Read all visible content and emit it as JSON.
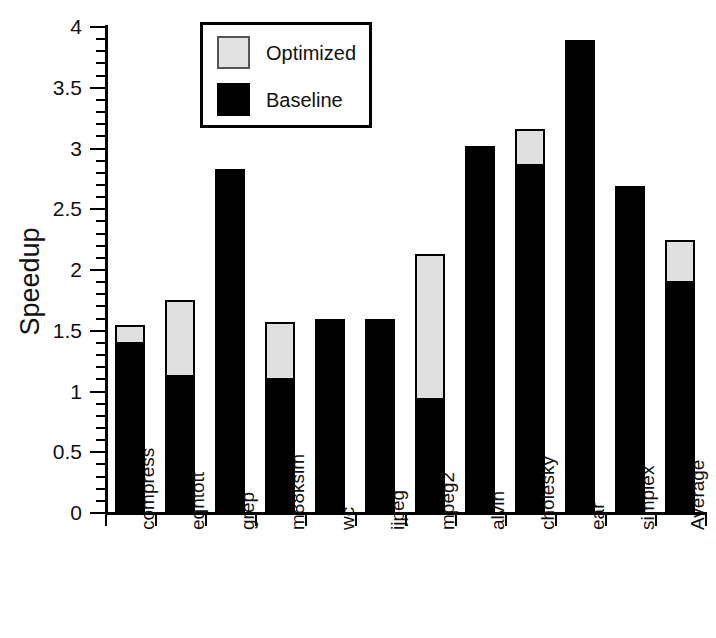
{
  "chart_data": {
    "type": "bar",
    "title": "",
    "subtitle": "",
    "xlabel": "",
    "ylabel": "Speedup",
    "ylim": [
      0,
      4
    ],
    "ytick_step": 0.5,
    "yminor_step": 0.1,
    "grid": false,
    "stacked": true,
    "legend_position": "top-left-inside",
    "categories": [
      "compress",
      "eqntott",
      "grep",
      "m88ksim",
      "wc",
      "ijpeg",
      "mpeg2",
      "alvin",
      "cholesky",
      "ear",
      "simplex",
      "Average"
    ],
    "ytick_labels": [
      "0",
      "0.5",
      "1",
      "1.5",
      "2",
      "2.5",
      "3",
      "3.5",
      "4"
    ],
    "ytick_values": [
      0,
      0.5,
      1,
      1.5,
      2,
      2.5,
      3,
      3.5,
      4
    ],
    "series": [
      {
        "name": "Optimized",
        "color": "#e0e0e0",
        "note": "total bar height (top of stack)",
        "values": [
          1.55,
          1.75,
          2.83,
          1.57,
          1.6,
          1.6,
          2.13,
          3.02,
          3.16,
          3.89,
          2.69,
          2.25
        ]
      },
      {
        "name": "Baseline",
        "color": "#000000",
        "note": "solid black lower portion of each bar",
        "values": [
          1.41,
          1.14,
          2.83,
          1.11,
          1.6,
          1.6,
          0.95,
          3.02,
          2.87,
          3.89,
          2.69,
          1.91
        ]
      }
    ]
  },
  "legend": {
    "items": [
      {
        "label": "Optimized",
        "swatch": "light-gray-square"
      },
      {
        "label": "Baseline",
        "swatch": "black-square"
      }
    ]
  },
  "axes": {
    "y_title": "Speedup"
  }
}
